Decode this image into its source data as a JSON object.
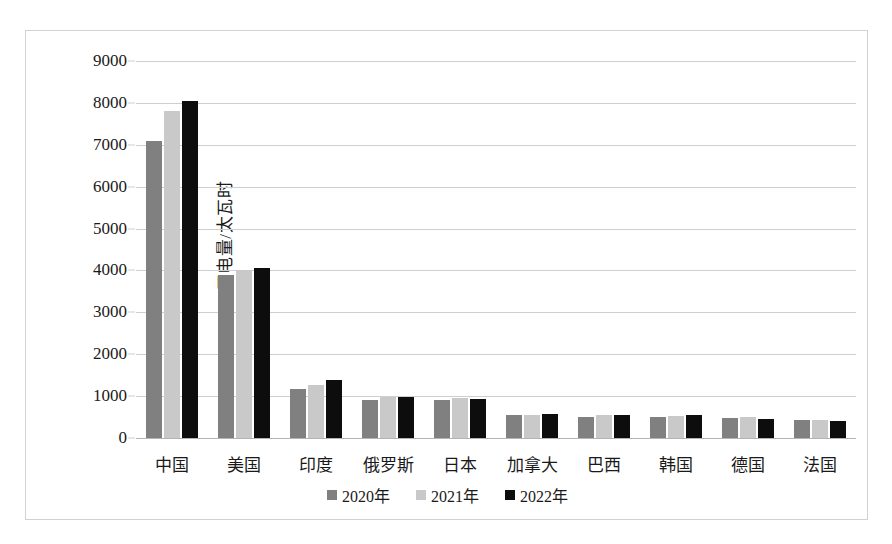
{
  "chart_data": {
    "type": "bar",
    "title": "",
    "subtitle": "",
    "xlabel": "",
    "ylabel": "用电量/太瓦时",
    "ylim": [
      0,
      9000
    ],
    "ytick_step": 1000,
    "yticks": [
      "9000",
      "8000",
      "7000",
      "6000",
      "5000",
      "4000",
      "3000",
      "2000",
      "1000",
      "0"
    ],
    "grid": true,
    "legend_position": "bottom",
    "categories": [
      "中国",
      "美国",
      "印度",
      "俄罗斯",
      "日本",
      "加拿大",
      "巴西",
      "韩国",
      "德国",
      "法国"
    ],
    "series": [
      {
        "name": "2020年",
        "color": "#808080",
        "values": [
          7100,
          3900,
          1180,
          910,
          910,
          540,
          510,
          510,
          480,
          420
        ]
      },
      {
        "name": "2021年",
        "color": "#c9c9c9",
        "values": [
          7800,
          4000,
          1270,
          980,
          960,
          560,
          540,
          530,
          500,
          430
        ]
      },
      {
        "name": "2022年",
        "color": "#0d0d0d",
        "values": [
          8050,
          4050,
          1390,
          970,
          920,
          570,
          560,
          550,
          460,
          400
        ]
      }
    ]
  },
  "legend": {
    "items": [
      {
        "label": "2020年",
        "swatch": "series-0-swatch"
      },
      {
        "label": "2021年",
        "swatch": "series-1-swatch"
      },
      {
        "label": "2022年",
        "swatch": "series-2-swatch"
      }
    ]
  },
  "colors": {
    "series_2020": "#808080",
    "series_2021": "#c9c9c9",
    "series_2022": "#0d0d0d",
    "gridline": "#cfcfcf",
    "frame_border": "#d2d2d2",
    "background": "#ffffff",
    "text": "#1a1a1a"
  }
}
